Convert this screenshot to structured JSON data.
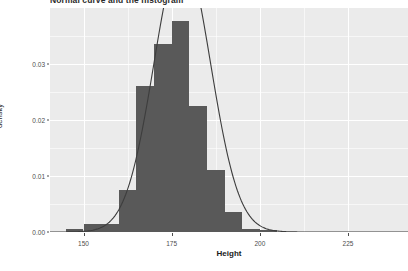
{
  "chart_data": {
    "type": "bar",
    "title": "Normal curve and the histogram",
    "xlabel": "Height",
    "ylabel": "density",
    "xlim": [
      140.5,
      242.0
    ],
    "ylim": [
      0.0,
      0.04
    ],
    "grid": true,
    "legend": null,
    "x_ticks": [
      150,
      175,
      200,
      225
    ],
    "x_tick_labels": [
      "150",
      "175",
      "200",
      "225"
    ],
    "y_ticks": [
      0.0,
      0.01,
      0.02,
      0.03
    ],
    "y_tick_labels": [
      "0.00",
      "0.01",
      "0.02",
      "0.03"
    ],
    "y_minor_ticks": [
      0.005,
      0.015,
      0.025,
      0.035
    ],
    "x_minor_ticks": [
      162.5,
      187.5,
      212.5
    ],
    "bar_color": "#595959",
    "panel_color": "#EBEBEB",
    "grid_color": "#FFFFFF",
    "curve_color": "#3D3D3D",
    "bin_width": 5,
    "bin_edges": [
      145,
      150,
      155,
      160,
      165,
      170,
      175,
      180,
      185,
      190,
      195,
      200,
      205
    ],
    "categories": [
      "145-150",
      "150-155",
      "155-160",
      "160-165",
      "165-170",
      "170-175",
      "175-180",
      "180-185",
      "185-190",
      "190-195",
      "195-200",
      "200-205"
    ],
    "values": [
      0.0006,
      0.0015,
      0.0015,
      0.0075,
      0.026,
      0.0335,
      0.0377,
      0.0225,
      0.011,
      0.0035,
      0.0006,
      0.0004
    ],
    "series": [
      {
        "name": "histogram density",
        "type": "bar",
        "values": [
          0.0006,
          0.0015,
          0.0015,
          0.0075,
          0.026,
          0.0335,
          0.0377,
          0.0225,
          0.011,
          0.0035,
          0.0006,
          0.0004
        ]
      },
      {
        "name": "normal curve",
        "type": "line",
        "mean": 178.0,
        "sd": 8.0,
        "peak": 0.0375
      }
    ]
  },
  "axes": {
    "x_title": "Height",
    "y_title": "density"
  }
}
